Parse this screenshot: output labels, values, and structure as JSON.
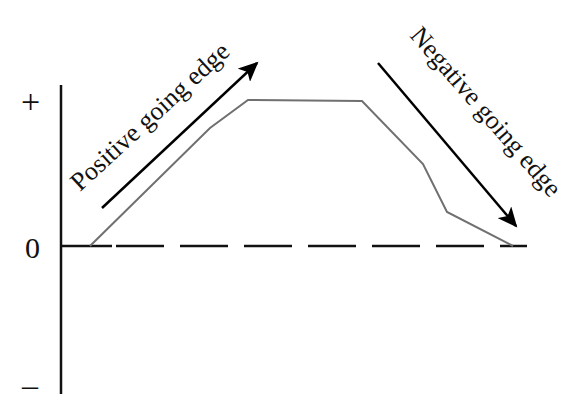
{
  "diagram": {
    "axis_labels": {
      "plus": "+",
      "zero": "0",
      "minus": "–"
    },
    "positive_edge_label": "Positive going edge",
    "negative_edge_label": "Negative going edge",
    "colors": {
      "axis": "#111111",
      "waveform": "#707070",
      "arrow": "#000000"
    },
    "waveform_points": "90,246 210,128 248,100 362,101 423,164 447,212 513,246"
  }
}
